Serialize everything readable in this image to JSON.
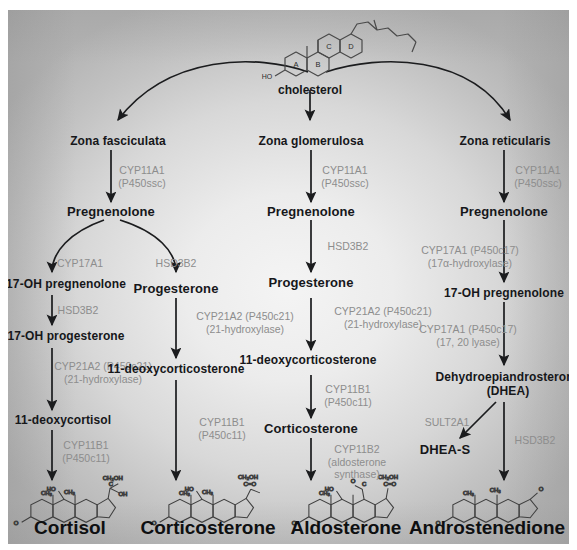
{
  "figure": {
    "title_visible": false,
    "colors": {
      "text": "#16171a",
      "enzyme_text": "#8d8d8d",
      "arrow": "#1b1c1e",
      "panel_light": "#f4f4f4",
      "panel_dark": "#b3b3b3"
    },
    "source_label": "cholesterol"
  },
  "precursor": {
    "label": "cholesterol",
    "ring_labels": [
      "A",
      "B",
      "C",
      "D"
    ],
    "hydroxyl_label": "HO"
  },
  "zones": [
    {
      "id": "fasciculata",
      "label": "Zona fasciculata"
    },
    {
      "id": "glomerulosa",
      "label": "Zona glomerulosa"
    },
    {
      "id": "reticularis",
      "label": "Zona reticularis"
    }
  ],
  "columns": [
    {
      "id": "cortisol-pathway",
      "zone": "Zona fasciculata",
      "product": "Cortisol",
      "metabolites": [
        "Pregnenolone",
        "17-OH pregnenolone",
        "17-OH progesterone",
        "11-deoxycortisol"
      ],
      "enzymes": [
        {
          "name": "CYP11A1",
          "alt": "(P450ssc)"
        },
        {
          "name": "CYP17A1",
          "alt": ""
        },
        {
          "name": "HSD3B2",
          "alt": ""
        },
        {
          "name": "CYP21A2 (P450c21)",
          "alt": "(21-hydroxylase)"
        },
        {
          "name": "CYP11B1",
          "alt": "(P450c11)"
        }
      ]
    },
    {
      "id": "corticosterone-pathway",
      "zone": "Zona fasciculata",
      "product": "Corticosterone",
      "metabolites": [
        "Progesterone",
        "11-deoxycorticosterone"
      ],
      "enzymes": [
        {
          "name": "HSD3B2",
          "alt": ""
        },
        {
          "name": "CYP21A2 (P450c21)",
          "alt": "(21-hydroxylase)"
        },
        {
          "name": "CYP11B1",
          "alt": "(P450c11)"
        }
      ]
    },
    {
      "id": "aldosterone-pathway",
      "zone": "Zona glomerulosa",
      "product": "Aldosterone",
      "metabolites": [
        "Pregnenolone",
        "Progesterone",
        "11-deoxycorticosterone",
        "Corticosterone"
      ],
      "enzymes": [
        {
          "name": "CYP11A1",
          "alt": "(P450ssc)"
        },
        {
          "name": "HSD3B2",
          "alt": ""
        },
        {
          "name": "CYP21A2 (P450c21)",
          "alt": "(21-hydroxylase)"
        },
        {
          "name": "CYP11B1",
          "alt": "(P450c11)"
        },
        {
          "name": "CYP11B2",
          "alt": "(aldosterone synthase)"
        }
      ]
    },
    {
      "id": "androstenedione-pathway",
      "zone": "Zona reticularis",
      "product": "Androstenedione",
      "metabolites": [
        "Pregnenolone",
        "17-OH pregnenolone",
        "Dehydroepiandrosterone (DHEA)",
        "DHEA-S"
      ],
      "enzymes": [
        {
          "name": "CYP11A1",
          "alt": "(P450ssc)"
        },
        {
          "name": "CYP17A1 (P450c17)",
          "alt": "(17α-hydroxylase)"
        },
        {
          "name": "CYP17A1 (P450c17)",
          "alt": "(17, 20 lyase)"
        },
        {
          "name": "SULT2A1",
          "alt": ""
        },
        {
          "name": "HSD3B2",
          "alt": ""
        }
      ]
    }
  ],
  "nodes": {
    "zona_fasciculata": "Zona fasciculata",
    "zona_glomerulosa": "Zona glomerulosa",
    "zona_reticularis": "Zona reticularis",
    "preg_c1": "Pregnenolone",
    "preg_c3": "Pregnenolone",
    "preg_c4": "Pregnenolone",
    "oh_preg_c1": "17-OH pregnenolone",
    "progesterone_c2": "Progesterone",
    "oh_prog_c1": "17-OH progesterone",
    "ddoc_c2": "11-deoxycorticosterone",
    "dcortisol_c1": "11-deoxycortisol",
    "progesterone_c3": "Progesterone",
    "ddoc_c3": "11-deoxycorticosterone",
    "corticosterone_c3": "Corticosterone",
    "oh_preg_c4": "17-OH pregnenolone",
    "dhea_line1": "Dehydroepiandrosterone",
    "dhea_line2": "(DHEA)",
    "dheas": "DHEA-S"
  },
  "enzyme_labels": {
    "c1_cyp11a1": "CYP11A1",
    "c1_cyp11a1_alt": "(P450ssc)",
    "c1_cyp17a1": "CYP17A1",
    "c1_hsd3b2_branch": "HSD3B2",
    "c1_hsd3b2": "HSD3B2",
    "c1_cyp21a2": "CYP21A2 (P450c21)",
    "c1_cyp21a2_alt": "(21-hydroxylase)",
    "c1_cyp11b1": "CYP11B1",
    "c1_cyp11b1_alt": "(P450c11)",
    "c2_cyp21a2": "CYP21A2 (P450c21)",
    "c2_cyp21a2_alt": "(21-hydroxylase)",
    "c2_cyp11b1": "CYP11B1",
    "c2_cyp11b1_alt": "(P450c11)",
    "c3_cyp11a1": "CYP11A1",
    "c3_cyp11a1_alt": "(P450ssc)",
    "c3_hsd3b2": "HSD3B2",
    "c3_cyp21a2": "CYP21A2 (P450c21)",
    "c3_cyp21a2_alt": "(21-hydroxylase)",
    "c3_cyp11b1": "CYP11B1",
    "c3_cyp11b1_alt": "(P450c11)",
    "c3_cyp11b2": "CYP11B2",
    "c3_cyp11b2_alt2": "(aldosterone",
    "c3_cyp11b2_alt3": "synthase)",
    "c4_cyp11a1": "CYP11A1",
    "c4_cyp11a1_alt": "(P450ssc)",
    "c4_cyp17a1_hyd": "CYP17A1 (P450c17)",
    "c4_cyp17a1_hyd_alt": "(17α-hydroxylase)",
    "c4_cyp17a1_lya": "CYP17A1 (P450c17)",
    "c4_cyp17a1_lya_alt": "(17, 20 lyase)",
    "c4_sult2a1": "SULT2A1",
    "c4_hsd3b2": "HSD3B2"
  },
  "products": [
    {
      "id": "cortisol",
      "label": "Cortisol"
    },
    {
      "id": "corticosterone",
      "label": "Corticosterone"
    },
    {
      "id": "aldosterone",
      "label": "Aldosterone"
    },
    {
      "id": "androstenedione",
      "label": "Androstenedione"
    }
  ],
  "product_labels": {
    "cortisol": "Cortisol",
    "corticosterone": "Corticosterone",
    "aldosterone": "Aldosterone",
    "androstenedione": "Androstenedione"
  },
  "structure_atom_labels": {
    "ho": "HO",
    "o": "O",
    "ch3": "CH₃",
    "ch2oh": "CH₂OH",
    "oh": "OH",
    "c": "C",
    "co": "C=O"
  }
}
